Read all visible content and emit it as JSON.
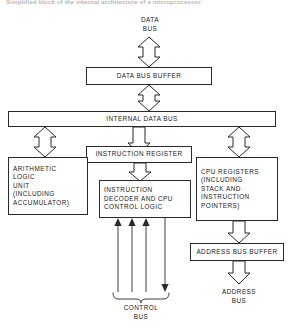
{
  "caption": {
    "text": "Simplified block of the internal architecture of a microprocessor"
  },
  "diagram": {
    "colors": {
      "line": "#2a2a2a",
      "background": "#ffffff",
      "text": "#1a1a1a"
    },
    "labels": {
      "data_bus": "DATA\nBUS",
      "control_bus": "CONTROL\nBUS",
      "address_bus": "ADDRESS\nBUS"
    },
    "blocks": {
      "data_bus_buffer": "DATA BUS BUFFER",
      "internal_data_bus": "INTERNAL DATA BUS",
      "instruction_register": "INSTRUCTION REGISTER",
      "alu": "ARITHMETIC\nLOGIC\nUNIT\n(INCLUDING\nACCUMULATOR)",
      "instruction_decoder": "INSTRUCTION\nDECODER AND CPU\nCONTROL LOGIC",
      "cpu_registers": "CPU REGISTERS\n(INCLUDING\nSTACK AND\nINSTRUCTION\nPOINTERS)",
      "address_bus_buffer": "ADDRESS BUS BUFFER"
    },
    "arrows": [
      {
        "name": "data-bus-to-buffer",
        "direction": "bidirectional",
        "style": "hollow"
      },
      {
        "name": "buffer-to-internal-bus",
        "direction": "bidirectional",
        "style": "hollow"
      },
      {
        "name": "internal-bus-to-alu",
        "direction": "bidirectional",
        "style": "hollow"
      },
      {
        "name": "internal-bus-to-instruction-register",
        "direction": "down",
        "style": "hollow"
      },
      {
        "name": "internal-bus-to-cpu-registers",
        "direction": "bidirectional",
        "style": "hollow"
      },
      {
        "name": "instruction-register-to-decoder",
        "direction": "down",
        "style": "hollow"
      },
      {
        "name": "cpu-registers-to-address-buffer",
        "direction": "down",
        "style": "hollow"
      },
      {
        "name": "address-buffer-to-address-bus",
        "direction": "down",
        "style": "hollow"
      },
      {
        "name": "control-bus-line-1",
        "direction": "up",
        "style": "thin"
      },
      {
        "name": "control-bus-line-2",
        "direction": "up",
        "style": "thin"
      },
      {
        "name": "control-bus-line-3",
        "direction": "up",
        "style": "thin"
      },
      {
        "name": "control-bus-line-4",
        "direction": "down",
        "style": "thin"
      }
    ]
  }
}
